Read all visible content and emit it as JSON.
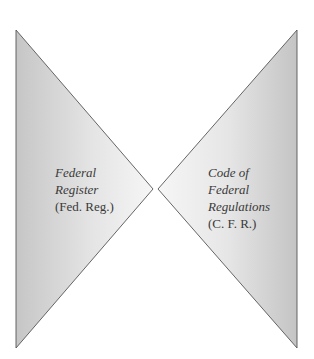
{
  "diagram": {
    "left_triangle": {
      "lines": [
        {
          "text": "Federal",
          "italic": true
        },
        {
          "text": "Register",
          "italic": true
        },
        {
          "text": "(Fed. Reg.)",
          "italic": false
        }
      ]
    },
    "right_triangle": {
      "lines": [
        {
          "text": "Code of",
          "italic": true
        },
        {
          "text": "Federal",
          "italic": true
        },
        {
          "text": "Regulations",
          "italic": true
        },
        {
          "text": "(C. F. R.)",
          "italic": false
        }
      ]
    },
    "colors": {
      "fill_light": "#f2f2f2",
      "fill_dark": "#c4c4c4",
      "stroke": "#555555",
      "text": "#3a3a3a"
    }
  }
}
